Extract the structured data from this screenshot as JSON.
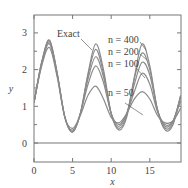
{
  "chart_data": {
    "type": "line",
    "title": "",
    "xlabel": "x",
    "ylabel": "y",
    "xlim": [
      0,
      19
    ],
    "ylim": [
      -0.35,
      3.3
    ],
    "xticks": [
      0,
      5,
      10,
      15
    ],
    "yticks": [
      0,
      1,
      2,
      3
    ],
    "grid": false,
    "legend": "inline annotations with leader lines",
    "annotations": [
      "Exact",
      "n = 400",
      "n = 200",
      "n = 100",
      "n = 50"
    ],
    "hline": 0,
    "series": [
      {
        "name": "Exact",
        "x": [
          0,
          1,
          2,
          3,
          4,
          5,
          6,
          7,
          8,
          9,
          10,
          11,
          12,
          13,
          14,
          15,
          16,
          17,
          18,
          19
        ],
        "y": [
          1.1,
          2.2,
          2.8,
          1.9,
          0.7,
          0.3,
          0.8,
          1.9,
          2.7,
          2.0,
          0.8,
          0.35,
          0.7,
          1.8,
          2.7,
          2.1,
          0.9,
          0.35,
          0.5,
          1.3
        ]
      },
      {
        "name": "n = 400",
        "x": [
          0,
          1,
          2,
          3,
          4,
          5,
          6,
          7,
          8,
          9,
          10,
          11,
          12,
          13,
          14,
          15,
          16,
          17,
          18,
          19
        ],
        "y": [
          1.1,
          2.2,
          2.8,
          1.9,
          0.7,
          0.3,
          0.8,
          1.85,
          2.55,
          1.9,
          0.8,
          0.4,
          0.75,
          1.75,
          2.45,
          2.0,
          0.9,
          0.4,
          0.55,
          1.3
        ]
      },
      {
        "name": "n = 200",
        "x": [
          0,
          1,
          2,
          3,
          4,
          5,
          6,
          7,
          8,
          9,
          10,
          11,
          12,
          13,
          14,
          15,
          16,
          17,
          18,
          19
        ],
        "y": [
          1.1,
          2.2,
          2.75,
          1.9,
          0.7,
          0.32,
          0.8,
          1.75,
          2.35,
          1.8,
          0.8,
          0.45,
          0.8,
          1.6,
          2.2,
          1.85,
          0.9,
          0.45,
          0.6,
          1.25
        ]
      },
      {
        "name": "n = 100",
        "x": [
          0,
          1,
          2,
          3,
          4,
          5,
          6,
          7,
          8,
          9,
          10,
          11,
          12,
          13,
          14,
          15,
          16,
          17,
          18,
          19
        ],
        "y": [
          1.1,
          2.15,
          2.7,
          1.85,
          0.7,
          0.35,
          0.8,
          1.6,
          2.1,
          1.65,
          0.8,
          0.5,
          0.8,
          1.4,
          1.9,
          1.6,
          0.85,
          0.5,
          0.6,
          1.15
        ]
      },
      {
        "name": "n = 50",
        "x": [
          0,
          1,
          2,
          3,
          4,
          5,
          6,
          7,
          8,
          9,
          10,
          11,
          12,
          13,
          14,
          15,
          16,
          17,
          18,
          19
        ],
        "y": [
          1.1,
          2.1,
          2.6,
          1.8,
          0.7,
          0.4,
          0.75,
          1.3,
          1.55,
          1.2,
          0.7,
          0.55,
          0.8,
          1.2,
          1.4,
          1.2,
          0.75,
          0.55,
          0.6,
          0.95
        ]
      }
    ]
  }
}
